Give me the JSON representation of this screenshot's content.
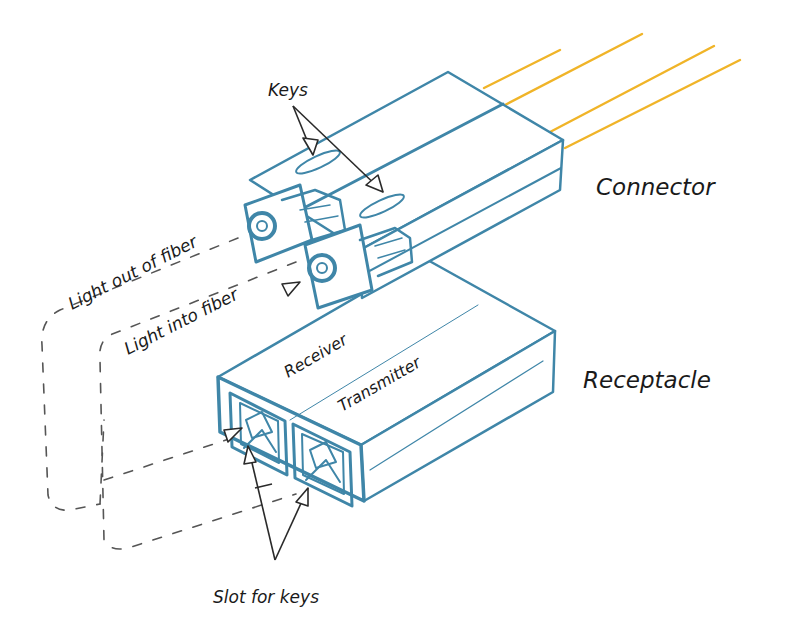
{
  "diagram": {
    "colors": {
      "outline": "#3f86a8",
      "fiber": "#f0b428",
      "text": "#1a1a1a",
      "pointer": "#2a2a2a",
      "background": "#ffffff"
    },
    "components": {
      "connector": {
        "label": "Connector",
        "fiber_count": 4
      },
      "receptacle": {
        "label": "Receptacle"
      }
    },
    "labels": {
      "keys": "Keys",
      "connector": "Connector",
      "light_out": "Light out of fiber",
      "light_in": "Light into fiber",
      "receiver": "Receiver",
      "transmitter": "Transmitter",
      "receptacle": "Receptacle",
      "slot_for_keys": "Slot for keys"
    }
  }
}
